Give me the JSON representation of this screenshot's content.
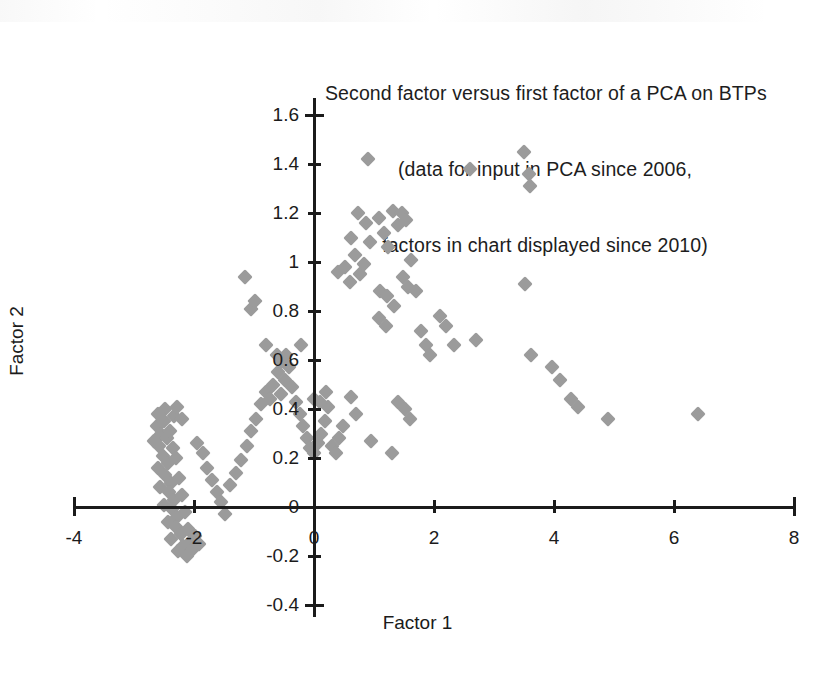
{
  "chart_data": {
    "type": "scatter",
    "title": "Second factor versus first factor of a PCA on BTPs\n(data for input in PCA since 2006,\nfactors in chart displayed since 2010)",
    "title_lines": [
      "Second factor versus first factor of a PCA on BTPs",
      "(data for input in PCA since 2006,",
      "factors in chart displayed since 2010)"
    ],
    "xlabel": "Factor 1",
    "ylabel": "Factor 2",
    "xlim": [
      -4,
      8
    ],
    "ylim": [
      -0.4,
      1.6
    ],
    "xticks": [
      -4,
      -2,
      0,
      2,
      4,
      6,
      8
    ],
    "xtick_labels": [
      "-4",
      "-2",
      "0",
      "2",
      "4",
      "6",
      "8"
    ],
    "yticks": [
      -0.4,
      -0.2,
      0,
      0.2,
      0.4,
      0.6,
      0.8,
      1.0,
      1.2,
      1.4,
      1.6
    ],
    "ytick_labels": [
      "-0.4",
      "-0.2",
      "0",
      "0.2",
      "0.4",
      "0.6",
      "0.8",
      "1",
      "1.2",
      "1.4",
      "1.6"
    ],
    "grid": false,
    "legend": false,
    "marker": {
      "shape": "diamond",
      "color": "#9b9b9b",
      "size_px": 11
    },
    "series": [
      {
        "name": "BTP observations",
        "points": [
          [
            -2.62,
            0.33
          ],
          [
            -2.55,
            0.3
          ],
          [
            -2.5,
            0.35
          ],
          [
            -2.45,
            0.28
          ],
          [
            -2.58,
            0.25
          ],
          [
            -2.4,
            0.31
          ],
          [
            -2.66,
            0.27
          ],
          [
            -2.35,
            0.24
          ],
          [
            -2.52,
            0.21
          ],
          [
            -2.44,
            0.18
          ],
          [
            -2.6,
            0.16
          ],
          [
            -2.3,
            0.2
          ],
          [
            -2.48,
            0.13
          ],
          [
            -2.38,
            0.1
          ],
          [
            -2.56,
            0.08
          ],
          [
            -2.25,
            0.12
          ],
          [
            -2.42,
            0.06
          ],
          [
            -2.33,
            0.03
          ],
          [
            -2.5,
            0.01
          ],
          [
            -2.2,
            0.05
          ],
          [
            -2.36,
            -0.01
          ],
          [
            -2.28,
            -0.04
          ],
          [
            -2.44,
            -0.06
          ],
          [
            -2.15,
            -0.02
          ],
          [
            -2.3,
            -0.08
          ],
          [
            -2.22,
            -0.11
          ],
          [
            -2.38,
            -0.13
          ],
          [
            -2.1,
            -0.09
          ],
          [
            -2.05,
            -0.14
          ],
          [
            -2.18,
            -0.16
          ],
          [
            -2.26,
            -0.18
          ],
          [
            -1.98,
            -0.12
          ],
          [
            -2.12,
            -0.2
          ],
          [
            -2.02,
            -0.17
          ],
          [
            -1.92,
            -0.15
          ],
          [
            -2.34,
            0.37
          ],
          [
            -2.48,
            0.4
          ],
          [
            -2.28,
            0.41
          ],
          [
            -2.2,
            0.36
          ],
          [
            -2.6,
            0.38
          ],
          [
            -1.95,
            0.26
          ],
          [
            -1.85,
            0.22
          ],
          [
            -1.78,
            0.16
          ],
          [
            -1.7,
            0.11
          ],
          [
            -1.62,
            0.06
          ],
          [
            -1.55,
            0.02
          ],
          [
            -1.48,
            -0.03
          ],
          [
            -1.4,
            0.09
          ],
          [
            -1.3,
            0.14
          ],
          [
            -1.22,
            0.19
          ],
          [
            -1.12,
            0.25
          ],
          [
            -1.05,
            0.31
          ],
          [
            -0.96,
            0.36
          ],
          [
            -0.88,
            0.42
          ],
          [
            -0.8,
            0.47
          ],
          [
            -0.74,
            0.44
          ],
          [
            -0.68,
            0.5
          ],
          [
            -0.6,
            0.55
          ],
          [
            -0.55,
            0.46
          ],
          [
            -0.48,
            0.52
          ],
          [
            -0.42,
            0.57
          ],
          [
            -0.36,
            0.49
          ],
          [
            -0.3,
            0.43
          ],
          [
            -0.24,
            0.38
          ],
          [
            -0.18,
            0.33
          ],
          [
            -0.12,
            0.28
          ],
          [
            -0.06,
            0.24
          ],
          [
            0.0,
            0.22
          ],
          [
            0.06,
            0.26
          ],
          [
            0.12,
            0.3
          ],
          [
            0.18,
            0.35
          ],
          [
            0.24,
            0.41
          ],
          [
            0.3,
            0.25
          ],
          [
            0.36,
            0.22
          ],
          [
            0.42,
            0.28
          ],
          [
            0.48,
            0.33
          ],
          [
            -1.05,
            0.81
          ],
          [
            -0.98,
            0.84
          ],
          [
            -1.15,
            0.94
          ],
          [
            -0.8,
            0.66
          ],
          [
            -0.62,
            0.62
          ],
          [
            -0.55,
            0.59
          ],
          [
            -0.46,
            0.62
          ],
          [
            -0.22,
            0.66
          ],
          [
            0.0,
            0.44
          ],
          [
            0.1,
            0.43
          ],
          [
            0.2,
            0.47
          ],
          [
            0.62,
            0.45
          ],
          [
            0.7,
            0.38
          ],
          [
            0.95,
            0.27
          ],
          [
            0.4,
            0.96
          ],
          [
            0.52,
            0.98
          ],
          [
            0.6,
            0.92
          ],
          [
            0.68,
            1.03
          ],
          [
            0.76,
            0.95
          ],
          [
            0.84,
            0.99
          ],
          [
            0.62,
            1.1
          ],
          [
            0.74,
            1.2
          ],
          [
            0.86,
            1.16
          ],
          [
            0.94,
            1.08
          ],
          [
            0.9,
            1.42
          ],
          [
            1.08,
            1.18
          ],
          [
            1.16,
            1.12
          ],
          [
            1.24,
            1.06
          ],
          [
            1.32,
            1.21
          ],
          [
            1.4,
            1.15
          ],
          [
            1.48,
            0.94
          ],
          [
            1.56,
            0.9
          ],
          [
            1.1,
            0.88
          ],
          [
            1.22,
            0.86
          ],
          [
            1.34,
            0.82
          ],
          [
            1.08,
            0.77
          ],
          [
            1.2,
            0.74
          ],
          [
            1.46,
            1.2
          ],
          [
            1.54,
            1.17
          ],
          [
            1.62,
            1.01
          ],
          [
            1.7,
            0.88
          ],
          [
            1.78,
            0.72
          ],
          [
            1.86,
            0.66
          ],
          [
            1.94,
            0.62
          ],
          [
            1.4,
            0.43
          ],
          [
            1.52,
            0.4
          ],
          [
            1.6,
            0.36
          ],
          [
            1.3,
            0.22
          ],
          [
            2.1,
            0.78
          ],
          [
            2.2,
            0.74
          ],
          [
            2.34,
            0.66
          ],
          [
            2.6,
            1.38
          ],
          [
            2.7,
            0.68
          ],
          [
            3.5,
            1.45
          ],
          [
            3.58,
            1.36
          ],
          [
            3.6,
            1.31
          ],
          [
            3.52,
            0.91
          ],
          [
            3.62,
            0.62
          ],
          [
            3.96,
            0.57
          ],
          [
            4.1,
            0.52
          ],
          [
            4.28,
            0.44
          ],
          [
            4.4,
            0.41
          ],
          [
            4.9,
            0.36
          ],
          [
            6.4,
            0.38
          ]
        ]
      }
    ]
  },
  "axes_geometry": {
    "origin_x_px": 314,
    "origin_y_px": 507,
    "px_per_unit_x": 60,
    "px_per_unit_y": 245
  }
}
